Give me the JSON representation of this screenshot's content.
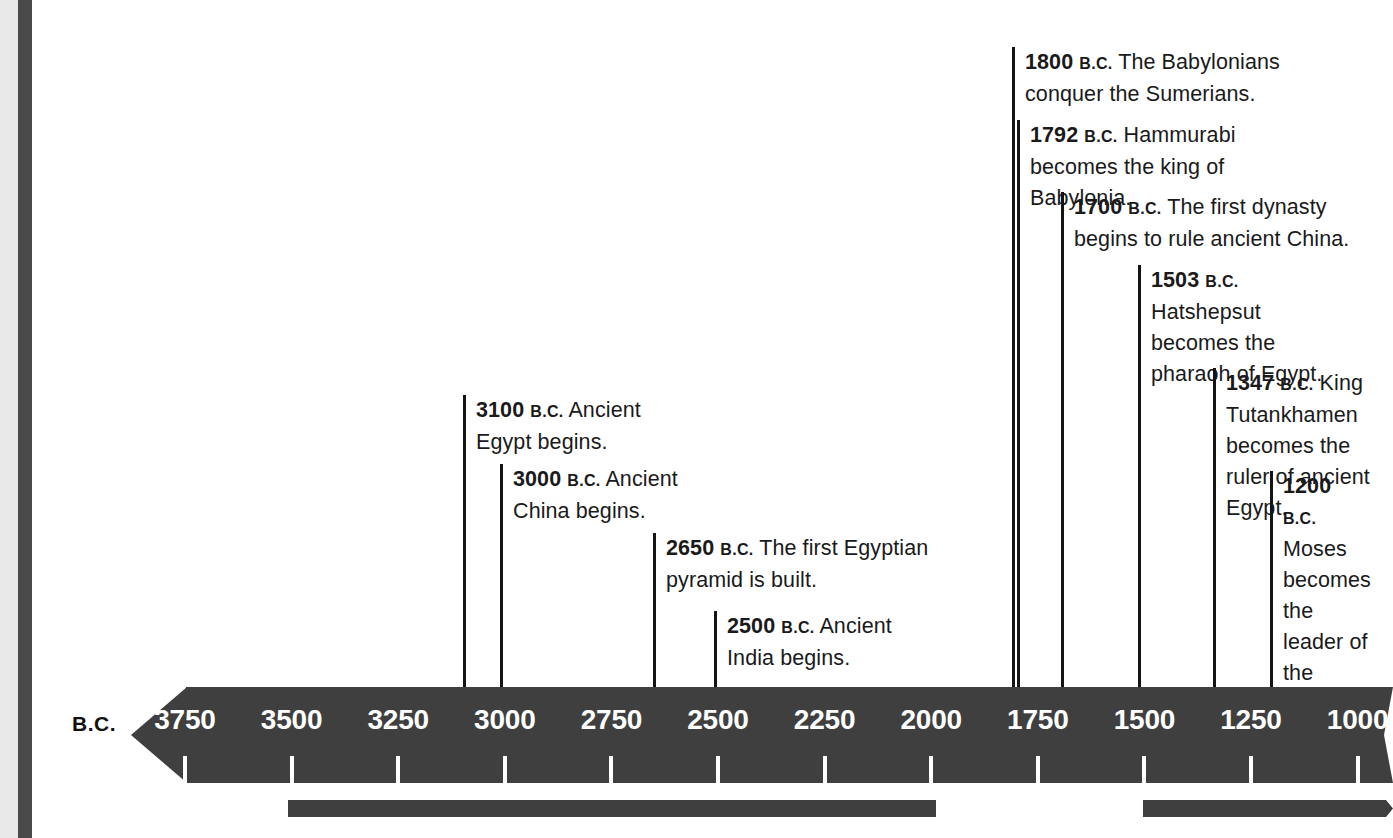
{
  "timeline": {
    "era_label": "B.C.",
    "axis": {
      "tick_labels": [
        "3750",
        "3500",
        "3250",
        "3000",
        "2750",
        "2500",
        "2250",
        "2000",
        "1750",
        "1500",
        "1250",
        "1000"
      ],
      "tick_values": [
        3750,
        3500,
        3250,
        3000,
        2750,
        2500,
        2250,
        2000,
        1750,
        1500,
        1250,
        1000
      ],
      "direction": "descending",
      "bar_color": "#3f3f3f",
      "label_color": "#ffffff"
    },
    "events": [
      {
        "year": "3100",
        "era": "B.C.",
        "text": "Ancient Egypt begins."
      },
      {
        "year": "3000",
        "era": "B.C.",
        "text": "Ancient China begins."
      },
      {
        "year": "2650",
        "era": "B.C.",
        "text": "The first Egyptian pyramid is built."
      },
      {
        "year": "2500",
        "era": "B.C.",
        "text": "Ancient India begins."
      },
      {
        "year": "1800",
        "era": "B.C.",
        "text": "The Babylonians conquer the Sumerians."
      },
      {
        "year": "1792",
        "era": "B.C.",
        "text": "Hammurabi becomes the king of Babylonia."
      },
      {
        "year": "1700",
        "era": "B.C.",
        "text": "The first dynasty begins to rule ancient China."
      },
      {
        "year": "1503",
        "era": "B.C.",
        "text": "Hatshepsut becomes the pharaoh of Egypt."
      },
      {
        "year": "1347",
        "era": "B.C.",
        "text": "King Tutankhamen becomes the ruler of ancient Egypt."
      },
      {
        "year": "1200",
        "era": "B.C.",
        "text": "Moses becomes the leader of the Jews."
      }
    ]
  },
  "chart_data": {
    "type": "timeline",
    "title": "",
    "xlabel": "B.C.",
    "axis_ticks": [
      3750,
      3500,
      3250,
      3000,
      2750,
      2500,
      2250,
      2000,
      1750,
      1500,
      1250,
      1000
    ],
    "xlim": [
      3900,
      950
    ],
    "points": [
      {
        "x": 3100,
        "label": "3100 B.C. Ancient Egypt begins."
      },
      {
        "x": 3000,
        "label": "3000 B.C. Ancient China begins."
      },
      {
        "x": 2650,
        "label": "2650 B.C. The first Egyptian pyramid is built."
      },
      {
        "x": 2500,
        "label": "2500 B.C. Ancient India begins."
      },
      {
        "x": 1800,
        "label": "1800 B.C. The Babylonians conquer the Sumerians."
      },
      {
        "x": 1792,
        "label": "1792 B.C. Hammurabi becomes the king of Babylonia."
      },
      {
        "x": 1700,
        "label": "1700 B.C. The first dynasty begins to rule ancient China."
      },
      {
        "x": 1503,
        "label": "1503 B.C. Hatshepsut becomes the pharaoh of Egypt."
      },
      {
        "x": 1347,
        "label": "1347 B.C. King Tutankhamen becomes the ruler of ancient Egypt."
      },
      {
        "x": 1200,
        "label": "1200 B.C. Moses becomes the leader of the Jews."
      }
    ],
    "span_bars": [
      {
        "from": 3500,
        "to": 2000
      },
      {
        "from": 1500,
        "to": 950
      }
    ],
    "grid": false,
    "legend": null
  }
}
